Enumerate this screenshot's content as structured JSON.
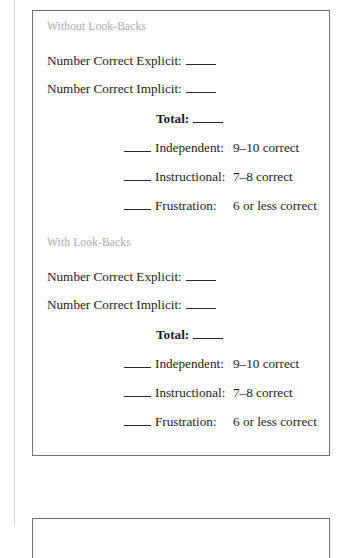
{
  "page": {
    "background_color": "#ffffff",
    "border_color": "#6f6f6f",
    "gutter_rule_color": "#d2d2d2",
    "heading_color": "#a9a9a9",
    "text_color": "#1b1b1b"
  },
  "worksheet": {
    "sections": [
      {
        "title": "Without Look-Backs",
        "counts": [
          {
            "label": "Number Correct Explicit:",
            "blank": "____"
          },
          {
            "label": "Number Correct Implicit:",
            "blank": "____"
          }
        ],
        "total": {
          "label": "Total:",
          "blank": "____"
        },
        "levels": [
          {
            "blank": "____",
            "label": "Independent:",
            "value": "9–10 correct"
          },
          {
            "blank": "____",
            "label": "Instructional:",
            "value": "7–8 correct"
          },
          {
            "blank": "____",
            "label": "Frustration:",
            "value": "6 or less correct"
          }
        ]
      },
      {
        "title": "With Look-Backs",
        "counts": [
          {
            "label": "Number Correct Explicit:",
            "blank": "____"
          },
          {
            "label": "Number Correct Implicit:",
            "blank": "____"
          }
        ],
        "total": {
          "label": "Total:",
          "blank": "____"
        },
        "levels": [
          {
            "blank": "____",
            "label": "Independent:",
            "value": "9–10 correct"
          },
          {
            "blank": "____",
            "label": "Instructional:",
            "value": "7–8 correct"
          },
          {
            "blank": "____",
            "label": "Frustration:",
            "value": "6 or less correct"
          }
        ]
      }
    ]
  }
}
